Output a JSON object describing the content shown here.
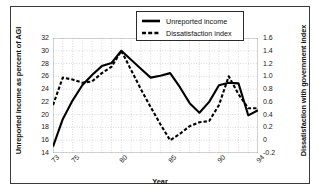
{
  "figure": {
    "xlabel": "Year",
    "ylabel_left": "Unreported income as percent of AGI",
    "ylabel_right": "Dissatisfaction with government index"
  },
  "legend": {
    "items": [
      {
        "label": "Unreported income",
        "style": "solid",
        "color": "#000000"
      },
      {
        "label": "Dissatisfaction index",
        "style": "dashed",
        "color": "#000000"
      }
    ]
  },
  "axes": {
    "left_ticks": [
      "14",
      "16",
      "18",
      "20",
      "22",
      "24",
      "26",
      "28",
      "30",
      "32"
    ],
    "right_ticks": [
      "-0.2",
      "0",
      "0.2",
      "0.4",
      "0.6",
      "0.8",
      "1.0",
      "1.2",
      "1.4",
      "1.6"
    ],
    "x_ticks": [
      "73",
      "75",
      "80",
      "85",
      "90",
      "94"
    ]
  },
  "chart_data": {
    "type": "line",
    "title": "",
    "xlabel": "Year",
    "ylabel": "Unreported income as percent of AGI",
    "ylabel_secondary": "Dissatisfaction with government index",
    "grid": true,
    "legend_position": "top-center",
    "xlim": [
      73,
      94
    ],
    "ylim": [
      14,
      32
    ],
    "ylim_secondary": [
      -0.2,
      1.6
    ],
    "x": [
      73,
      74,
      75,
      76,
      77,
      78,
      79,
      80,
      81,
      82,
      83,
      84,
      85,
      86,
      87,
      88,
      89,
      90,
      91,
      92,
      93,
      94
    ],
    "xtick_values": [
      73,
      75,
      80,
      85,
      90,
      94
    ],
    "ytick_values": [
      14,
      16,
      18,
      20,
      22,
      24,
      26,
      28,
      30,
      32
    ],
    "ytick_values_secondary": [
      -0.2,
      0,
      0.2,
      0.4,
      0.6,
      0.8,
      1.0,
      1.2,
      1.4,
      1.6
    ],
    "series": [
      {
        "name": "Unreported income",
        "axis": "left",
        "style": "solid",
        "color": "#000000",
        "values": [
          15.0,
          19.3,
          22.2,
          24.6,
          26.2,
          27.6,
          28.1,
          30.0,
          28.6,
          27.2,
          25.8,
          26.1,
          26.5,
          24.3,
          21.8,
          20.3,
          22.0,
          24.6,
          25.0,
          24.9,
          19.9,
          20.7
        ]
      },
      {
        "name": "Dissatisfaction index",
        "axis": "right",
        "style": "dashed",
        "color": "#000000",
        "values": [
          0.55,
          0.98,
          0.95,
          0.9,
          0.92,
          1.05,
          1.15,
          1.4,
          1.1,
          0.8,
          0.52,
          0.25,
          0.0,
          0.1,
          0.22,
          0.28,
          0.3,
          0.55,
          1.0,
          0.72,
          0.5,
          0.5
        ]
      }
    ]
  }
}
